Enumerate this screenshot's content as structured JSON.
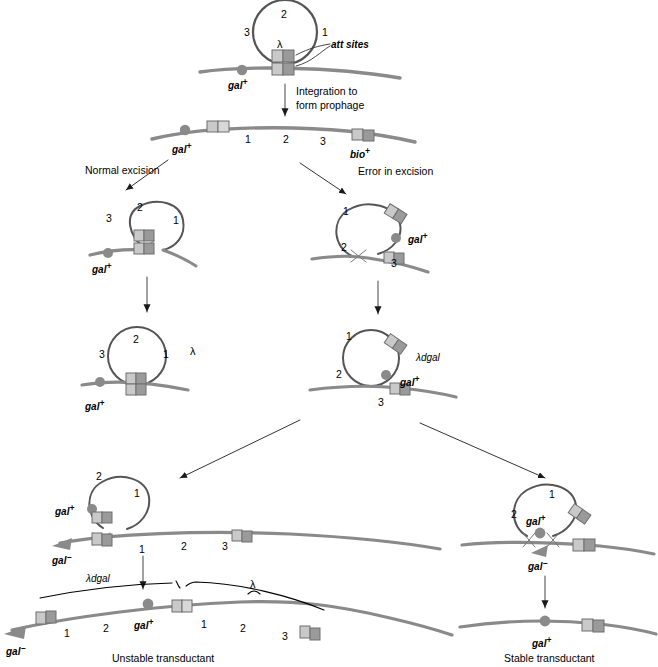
{
  "diagram": {
    "colors": {
      "dna_line": "#8a8a8a",
      "circle_line": "#6b6b6b",
      "box_light": "#c9c9c9",
      "box_dark": "#9a9a9a",
      "marker_gray": "#8a8a8a",
      "brace_black": "#000000",
      "text": "#000000"
    },
    "symbols": {
      "lambda": "λ",
      "lambda_dgal": "λdgal",
      "gal_plus": "gal",
      "gal_minus": "gal",
      "sup_plus": "+",
      "sup_minus": "−",
      "bio_plus": "bio"
    },
    "steps": {
      "top_circle": {
        "name": "lambda-phage-circle",
        "markers": [
          "3",
          "2",
          "1"
        ],
        "lambda_label": "λ",
        "att_label": "att sites",
        "host_marker": "gal",
        "host_marker_sup": "+"
      },
      "integration_arrow": {
        "line1": "Integration to",
        "line2": "form prophage"
      },
      "prophage": {
        "name": "prophage-chromosome",
        "left_marker": "gal",
        "left_sup": "+",
        "right_marker": "bio",
        "right_sup": "+",
        "markers": [
          "1",
          "2",
          "3"
        ]
      },
      "branch_left_label": "Normal excision",
      "branch_right_label": "Error in excision",
      "normal_excision_loop": {
        "name": "normal-excision-loop",
        "markers": [
          "3",
          "2",
          "1"
        ],
        "host_marker": "gal",
        "host_sup": "+"
      },
      "error_excision_loop": {
        "name": "error-excision-loop",
        "markers": [
          "1",
          "2",
          "3"
        ],
        "loop_marker": "gal",
        "loop_sup": "+"
      },
      "lambda_product": {
        "name": "lambda-circle-product",
        "markers": [
          "3",
          "2",
          "1"
        ],
        "label": "λ",
        "host_marker": "gal",
        "host_sup": "+"
      },
      "lambda_dgal_product": {
        "name": "lambda-dgal-circle",
        "markers": [
          "1",
          "2",
          "3"
        ],
        "label": "λdgal",
        "loop_marker": "gal",
        "loop_sup": "+"
      },
      "unstable_branch": {
        "name": "unstable-transductant-integration",
        "loop_markers": [
          "2",
          "1"
        ],
        "loop_gal": "gal",
        "loop_gal_sup": "+",
        "host_gal": "gal",
        "host_gal_sup": "−",
        "chromosome_markers": [
          "1",
          "2",
          "3"
        ]
      },
      "unstable_result": {
        "name": "unstable-transductant",
        "caption": "Unstable transductant",
        "brace_left": "λdgal",
        "brace_right": "λ",
        "left_gal": "gal",
        "left_gal_sup": "−",
        "mid_gal": "gal",
        "mid_gal_sup": "+",
        "markers_left": [
          "1",
          "2"
        ],
        "markers_right": [
          "1",
          "2",
          "3"
        ]
      },
      "stable_branch": {
        "name": "stable-transductant-recombination",
        "loop_markers": [
          "2",
          "1"
        ],
        "loop_gal": "gal",
        "loop_gal_sup": "+",
        "host_gal": "gal",
        "host_gal_sup": "−"
      },
      "stable_result": {
        "name": "stable-transductant",
        "caption": "Stable transductant",
        "gal": "gal",
        "gal_sup": "+"
      }
    }
  }
}
